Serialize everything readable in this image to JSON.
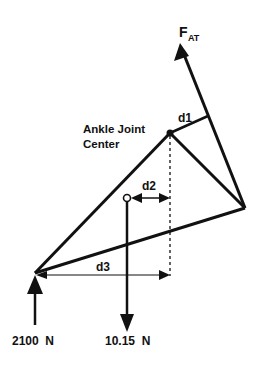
{
  "diagram": {
    "type": "free-body diagram of foot / ankle",
    "colors": {
      "line": "#111111",
      "background": "#ffffff"
    },
    "labels": {
      "force_achilles_main": "F",
      "force_achilles_sub": "AT",
      "joint_line1": "Ankle Joint",
      "joint_line2": "Center",
      "d1": "d1",
      "d2": "d2",
      "d3": "d3",
      "ground_force": "2100  N",
      "weight_force": "10.15  N"
    },
    "points": {
      "ankle_joint_center": [
        170,
        133
      ],
      "heel_vertex": [
        245,
        208
      ],
      "toe_vertex": [
        35,
        273
      ],
      "center_of_mass": [
        127,
        198
      ],
      "f_at_tip": [
        180,
        43
      ]
    }
  }
}
